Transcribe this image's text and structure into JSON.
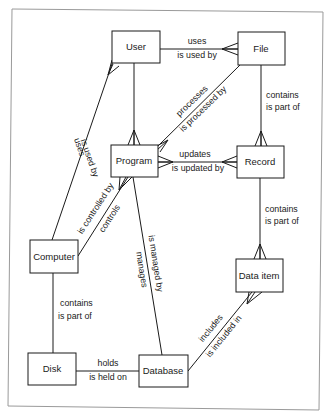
{
  "diagram": {
    "type": "entity-relationship",
    "entities": [
      {
        "id": "user",
        "label": "User",
        "x": 112,
        "y": 31,
        "w": 48,
        "h": 32
      },
      {
        "id": "file",
        "label": "File",
        "x": 238,
        "y": 32,
        "w": 47,
        "h": 33
      },
      {
        "id": "program",
        "label": "Program",
        "x": 111,
        "y": 145,
        "w": 47,
        "h": 32
      },
      {
        "id": "record",
        "label": "Record",
        "x": 237,
        "y": 146,
        "w": 47,
        "h": 32
      },
      {
        "id": "computer",
        "label": "Computer",
        "x": 30,
        "y": 240,
        "w": 48,
        "h": 33
      },
      {
        "id": "data_item",
        "label": "Data item",
        "x": 236,
        "y": 259,
        "w": 47,
        "h": 33
      },
      {
        "id": "disk",
        "label": "Disk",
        "x": 28,
        "y": 353,
        "w": 48,
        "h": 32
      },
      {
        "id": "database",
        "label": "Database",
        "x": 139,
        "y": 355,
        "w": 49,
        "h": 32
      }
    ],
    "relationships": [
      {
        "from": "user",
        "to": "file",
        "forward": "uses",
        "reverse": "is used by",
        "many_end": "file"
      },
      {
        "from": "user",
        "to": "program",
        "forward": "",
        "reverse": "",
        "many_end": "program"
      },
      {
        "from": "file",
        "to": "program",
        "forward": "processes",
        "reverse": "is processed by",
        "many_end": "program"
      },
      {
        "from": "file",
        "to": "record",
        "forward": "contains",
        "reverse": "is part of",
        "many_end": "record"
      },
      {
        "from": "computer",
        "to": "user",
        "forward": "uses",
        "reverse": "is used by",
        "many_end": "user"
      },
      {
        "from": "program",
        "to": "record",
        "forward": "updates",
        "reverse": "is updated by",
        "many_end": "both"
      },
      {
        "from": "computer",
        "to": "program",
        "forward": "controls",
        "reverse": "is controlled by",
        "many_end": "program"
      },
      {
        "from": "program",
        "to": "database",
        "forward": "manages",
        "reverse": "is managed by",
        "many_end": "none"
      },
      {
        "from": "record",
        "to": "data_item",
        "forward": "contains",
        "reverse": "is part of",
        "many_end": "data_item"
      },
      {
        "from": "computer",
        "to": "disk",
        "forward": "contains",
        "reverse": "is part of",
        "many_end": "none"
      },
      {
        "from": "disk",
        "to": "database",
        "forward": "holds",
        "reverse": "is held on",
        "many_end": "none"
      },
      {
        "from": "database",
        "to": "data_item",
        "forward": "includes",
        "reverse": "is included in",
        "many_end": "data_item"
      }
    ]
  },
  "labels": {
    "user": "User",
    "file": "File",
    "program": "Program",
    "record": "Record",
    "computer": "Computer",
    "data_item": "Data item",
    "disk": "Disk",
    "database": "Database",
    "uses": "uses",
    "is_used_by": "is used by",
    "processes": "processes",
    "is_processed_by": "is processed by",
    "contains": "contains",
    "is_part_of": "is part of",
    "updates": "updates",
    "is_updated_by": "is updated by",
    "controls": "controls",
    "is_controlled_by": "is controlled by",
    "manages": "manages",
    "is_managed_by": "is managed by",
    "holds": "holds",
    "is_held_on": "is held on",
    "includes": "includes",
    "is_included_in": "is included in"
  },
  "colors": {
    "line": "#1a1a1a",
    "frame": "#9a9a9a",
    "background": "#ffffff"
  }
}
